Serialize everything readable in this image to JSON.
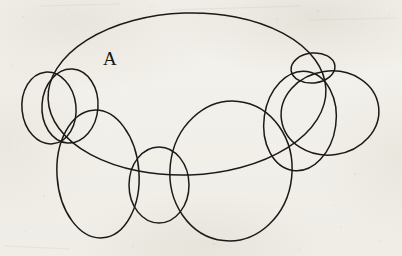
{
  "figure": {
    "background_color": "#f2f0ea",
    "ink_color": "#1b1a18",
    "labels": [
      {
        "id": "label-A",
        "text": "A",
        "x": 103,
        "y": 48
      }
    ],
    "shapes": [
      {
        "name": "outer-ellipse-A",
        "role": "large outer ellipse enclosing the figure, labeled A",
        "cx": 187,
        "cy": 94,
        "rx": 139,
        "ry": 81,
        "rotation": -2,
        "stroke_width": 1.5
      },
      {
        "name": "left-small-circle",
        "role": "small circle at far left",
        "cx": 49,
        "cy": 108,
        "rx": 27,
        "ry": 36,
        "rotation": -6,
        "stroke_width": 1.5
      },
      {
        "name": "left-inner-circle",
        "role": "circle overlapping the far-left circle",
        "cx": 70,
        "cy": 106,
        "rx": 28,
        "ry": 37,
        "rotation": 4,
        "stroke_width": 1.5
      },
      {
        "name": "lower-left-ellipse",
        "role": "tall ellipse in lower-left region",
        "cx": 98,
        "cy": 174,
        "rx": 41,
        "ry": 64,
        "rotation": -4,
        "stroke_width": 1.5
      },
      {
        "name": "center-small-ellipse",
        "role": "small ellipse at center-bottom",
        "cx": 159,
        "cy": 185,
        "rx": 30,
        "ry": 38,
        "rotation": 0,
        "stroke_width": 1.5
      },
      {
        "name": "lower-right-large-ellipse",
        "role": "large ellipse in lower-right region",
        "cx": 231,
        "cy": 171,
        "rx": 61,
        "ry": 70,
        "rotation": 6,
        "stroke_width": 1.5
      },
      {
        "name": "right-large-ellipse",
        "role": "large ellipse at right side",
        "cx": 330,
        "cy": 113,
        "rx": 49,
        "ry": 42,
        "rotation": -8,
        "stroke_width": 1.5
      },
      {
        "name": "right-inner-ellipse",
        "role": "ellipse overlapping right large ellipse, reaching down-left",
        "cx": 300,
        "cy": 121,
        "rx": 36,
        "ry": 50,
        "rotation": 8,
        "stroke_width": 1.5
      },
      {
        "name": "top-right-small-ellipse",
        "role": "small flattened ellipse at top right",
        "cx": 313,
        "cy": 68,
        "rx": 22,
        "ry": 15,
        "rotation": -6,
        "stroke_width": 1.5
      }
    ]
  }
}
